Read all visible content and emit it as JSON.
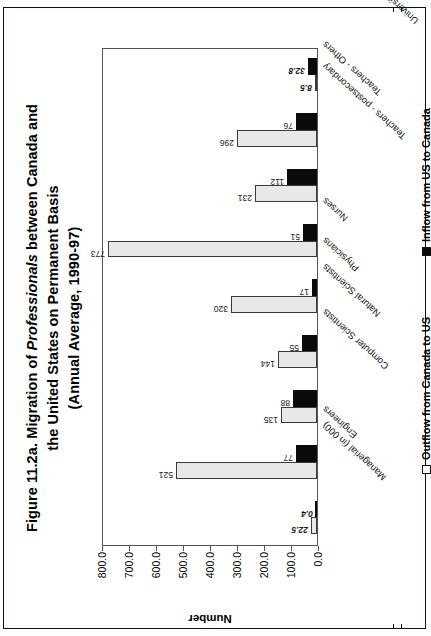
{
  "figure": {
    "title_line1": "Figure 11.2a. Migration of ",
    "title_italic": "Professionals",
    "title_line1b": " between Canada and",
    "title_line2": "the United States on Permanent Basis",
    "title_line3": "(Annual Average, 1990-97)"
  },
  "legend": {
    "outflow_label": "Outflow from Canada to US",
    "inflow_label": "Inflow from US to Canada",
    "outflow_color": "#ffffff",
    "inflow_color": "#0b0b0b"
  },
  "axes": {
    "ylabel": "Number",
    "yticks": [
      "800.0",
      "700.0",
      "600.0",
      "500.0",
      "400.0",
      "300.0",
      "200.0",
      "100.0",
      "0.0"
    ]
  },
  "chart_data": {
    "type": "bar",
    "title": "Figure 11.2a. Migration of Professionals between Canada and the United States on Permanent Basis (Annual Average, 1990-97)",
    "xlabel": "",
    "ylabel": "Number",
    "ylim": [
      0,
      800
    ],
    "ytick_step": 100,
    "grid": false,
    "legend_position": "bottom",
    "orientation": "vertical-bars-rotated-page",
    "categories": [
      "Managerial (in 000)",
      "Engineers",
      "Computer Scientists",
      "Natural Scientists",
      "Physicians",
      "Nurses",
      "Teachers - postsecondary",
      "Teachers - Others",
      "University graduates (in 000)*"
    ],
    "series": [
      {
        "name": "Outflow from Canada to US",
        "values": [
          22.5,
          521,
          135,
          144,
          320,
          773,
          231,
          296,
          8.5
        ],
        "labels": [
          "22.5",
          "521",
          "135",
          "144",
          "320",
          "773",
          "231",
          "296",
          "8.5"
        ]
      },
      {
        "name": "Inflow from US to Canada",
        "values": [
          0.4,
          77,
          88,
          55,
          17,
          51,
          112,
          76,
          32.8
        ],
        "labels": [
          "0.4",
          "77",
          "88",
          "55",
          "17",
          "51",
          "112",
          "76",
          "32.8"
        ]
      }
    ],
    "emphasized_labels": [
      "22.5",
      "0.4",
      "8.5",
      "32.8"
    ]
  }
}
